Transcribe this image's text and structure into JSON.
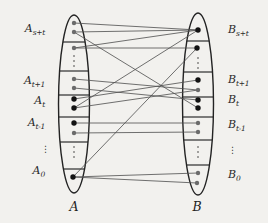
{
  "figure": {
    "background": "#f2f1ee",
    "ink": "#232323",
    "edge_color": "#505050",
    "point_gray": "#6b6b6b",
    "point_black": "#121212",
    "left": {
      "set_label": "A",
      "cx": 74,
      "cy": 104,
      "rx": 15.5,
      "ry": 89,
      "chords": [
        42,
        71,
        95,
        117,
        142,
        169
      ],
      "points": [
        {
          "x": 74,
          "y": 23,
          "k": "g"
        },
        {
          "x": 74,
          "y": 32,
          "k": "g"
        },
        {
          "x": 74,
          "y": 48,
          "k": "g"
        },
        {
          "x": 74,
          "y": 79,
          "k": "g"
        },
        {
          "x": 74,
          "y": 88,
          "k": "g"
        },
        {
          "x": 74,
          "y": 99,
          "k": "b"
        },
        {
          "x": 74,
          "y": 108,
          "k": "b"
        },
        {
          "x": 74,
          "y": 123,
          "k": "b"
        },
        {
          "x": 74,
          "y": 133,
          "k": "g"
        },
        {
          "x": 73,
          "y": 177,
          "k": "b"
        }
      ],
      "vdots": [
        {
          "x": 74,
          "ys": [
            56,
            61,
            66
          ]
        },
        {
          "x": 74,
          "ys": [
            147,
            152,
            157
          ]
        }
      ],
      "label_x": 74,
      "label_y": 199
    },
    "right": {
      "set_label": "B",
      "cx": 198,
      "cy": 104,
      "rx": 15.5,
      "ry": 91,
      "chords": [
        41,
        72,
        97,
        117,
        140,
        165
      ],
      "points": [
        {
          "x": 198,
          "y": 30,
          "k": "b"
        },
        {
          "x": 197,
          "y": 48,
          "k": "b"
        },
        {
          "x": 198,
          "y": 80,
          "k": "b"
        },
        {
          "x": 198,
          "y": 90,
          "k": "g"
        },
        {
          "x": 198,
          "y": 100,
          "k": "b"
        },
        {
          "x": 198,
          "y": 108,
          "k": "b"
        },
        {
          "x": 198,
          "y": 123,
          "k": "g"
        },
        {
          "x": 198,
          "y": 132,
          "k": "g"
        },
        {
          "x": 198,
          "y": 173,
          "k": "g"
        },
        {
          "x": 197,
          "y": 183,
          "k": "g"
        }
      ],
      "vdots": [
        {
          "x": 198,
          "ys": [
            58,
            63,
            68
          ]
        },
        {
          "x": 198,
          "ys": [
            147,
            152,
            157
          ]
        }
      ],
      "label_x": 197,
      "label_y": 199
    },
    "edges": [
      [
        0,
        0
      ],
      [
        1,
        0
      ],
      [
        2,
        0
      ],
      [
        2,
        1
      ],
      [
        1,
        5
      ],
      [
        6,
        0
      ],
      [
        9,
        1
      ],
      [
        3,
        3
      ],
      [
        4,
        4
      ],
      [
        5,
        2
      ],
      [
        6,
        3
      ],
      [
        7,
        6
      ],
      [
        8,
        7
      ],
      [
        9,
        8
      ],
      [
        9,
        9
      ]
    ],
    "left_labels": [
      {
        "base": "A",
        "sub": "s+t",
        "y": 30
      },
      {
        "base": "A",
        "sub": "t+1",
        "y": 82
      },
      {
        "base": "A",
        "sub": "t",
        "y": 102
      },
      {
        "base": "A",
        "sub": "t-1",
        "y": 124
      },
      {
        "base": "A",
        "sub": "0",
        "y": 172
      }
    ],
    "left_vdots_label": {
      "x": 41,
      "y": 145,
      "text": "⋮"
    },
    "right_labels": [
      {
        "base": "B",
        "sub": "s+t",
        "y": 31
      },
      {
        "base": "B",
        "sub": "t+1",
        "y": 81
      },
      {
        "base": "B",
        "sub": "t",
        "y": 101
      },
      {
        "base": "B",
        "sub": "t-1",
        "y": 126
      },
      {
        "base": "B",
        "sub": "0",
        "y": 176
      }
    ],
    "right_vdots_label": {
      "x": 228,
      "y": 146,
      "text": "⋮"
    }
  }
}
